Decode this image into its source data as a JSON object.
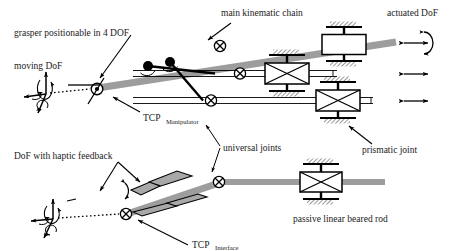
{
  "figure": {
    "background_color": "#ffffff",
    "rod_color": "#9d9d9d",
    "rod_edge_color": "#6e6e6e",
    "line_color": "#000000",
    "text_color": "#1a1a1a"
  },
  "labels": {
    "grasper": "grasper positionable in 4 DOF",
    "moving_dof": "moving DoF",
    "main_chain": "main kinematic chain",
    "actuated_dof": "actuated DoF",
    "tcp_manipulator_main": "TCP",
    "tcp_manipulator_sub": "Manipulator",
    "universal_joints": "universal joints",
    "prismatic_joint": "prismatic joint",
    "haptic_dof": "DoF with haptic feedback",
    "tcp_interface_main": "TCP",
    "tcp_interface_sub": "Interface",
    "passive_rod": "passive linear beared rod"
  },
  "joints": {
    "universal_joint_icon": "circle-x-icon",
    "revolute_joint_icon": "filled-circle-icon",
    "prismatic_joint_icon": "box-with-x-icon",
    "actuator_icon": "plain-box-icon",
    "ground_icon": "hatched-ground-icon",
    "universal_joint_count": 4,
    "revolute_joint_count": 2,
    "prismatic_joint_count": 3
  },
  "dof_indicators": {
    "rotational_arrow_icon": "curved-rotation-arrow-icon",
    "translational_arrow_icon": "double-headed-arrow-icon",
    "frame_icon": "three-axis-frame-icon",
    "actuated_rows": [
      {
        "type": "rotation-and-translation"
      },
      {
        "type": "translation"
      },
      {
        "type": "translation"
      }
    ]
  },
  "grasper": {
    "jaw_icon": "gripper-jaw-icon",
    "jaw_fill": "#a8a8a8",
    "jaw_count": 2,
    "open_close_arrow_icon": "curved-open-close-arrow-icon"
  }
}
